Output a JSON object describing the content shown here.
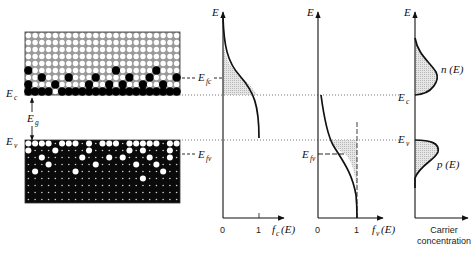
{
  "figure": {
    "lattice": {
      "columns": 23,
      "rows": 9,
      "conduction_band": {
        "description": "Conduction band: mostly empty states (white) with electrons (black) filling near the bottom",
        "filled_cells": [
          [
            5,
            0
          ],
          [
            5,
            13
          ],
          [
            5,
            19
          ],
          [
            6,
            2
          ],
          [
            6,
            6
          ],
          [
            6,
            10
          ],
          [
            6,
            15
          ],
          [
            6,
            18
          ],
          [
            6,
            22
          ],
          [
            7,
            0
          ],
          [
            7,
            4
          ],
          [
            7,
            9
          ],
          [
            7,
            12
          ],
          [
            7,
            14
          ],
          [
            7,
            17
          ],
          [
            7,
            20
          ],
          [
            8,
            0
          ],
          [
            8,
            1
          ],
          [
            8,
            3
          ],
          [
            8,
            5
          ],
          [
            8,
            7
          ],
          [
            8,
            8
          ],
          [
            8,
            11
          ],
          [
            8,
            12
          ],
          [
            8,
            13
          ],
          [
            8,
            15
          ],
          [
            8,
            16
          ],
          [
            8,
            18
          ],
          [
            8,
            19
          ],
          [
            8,
            21
          ],
          [
            8,
            22
          ]
        ],
        "bottom_row_filled": [
          1,
          2,
          3,
          5,
          6,
          7,
          9,
          10,
          11,
          12,
          13,
          14,
          16,
          17,
          18,
          19,
          20,
          21,
          22
        ]
      },
      "valence_band": {
        "description": "Valence band: mostly filled states (black) with holes (white) near the top",
        "top_row_holes": [
          0,
          1,
          2,
          3,
          5,
          6,
          7,
          9,
          11,
          12,
          13,
          15,
          16,
          17,
          18,
          19,
          21,
          22
        ],
        "holes": [
          [
            1,
            0
          ],
          [
            1,
            4
          ],
          [
            1,
            9
          ],
          [
            1,
            15
          ],
          [
            1,
            17
          ],
          [
            1,
            21
          ],
          [
            2,
            2
          ],
          [
            2,
            8
          ],
          [
            2,
            12
          ],
          [
            2,
            14
          ],
          [
            2,
            18
          ],
          [
            2,
            21
          ],
          [
            3,
            3
          ],
          [
            3,
            10
          ],
          [
            3,
            16
          ],
          [
            3,
            19
          ],
          [
            4,
            1
          ],
          [
            4,
            7
          ],
          [
            4,
            20
          ],
          [
            5,
            17
          ]
        ]
      }
    },
    "labels": {
      "Ec": "E",
      "Ec_sub": "c",
      "Ev": "E",
      "Ev_sub": "v",
      "Eg": "E",
      "Eg_sub": "g",
      "Efc": "E",
      "Efc_sub": "fc",
      "Efv": "E",
      "Efv_sub": "fv"
    },
    "plot_fc": {
      "y_axis_label": "E",
      "x_axis_label": "f",
      "x_axis_sub": "c",
      "x_axis_arg": "(E)",
      "ticks": [
        "0",
        "1"
      ]
    },
    "plot_fv": {
      "y_axis_label": "E",
      "x_axis_label": "f",
      "x_axis_sub": "v",
      "x_axis_arg": "(E)",
      "ticks": [
        "0",
        "1"
      ]
    },
    "plot_carriers": {
      "y_axis_label": "E",
      "x_axis_label_line1": "Carrier",
      "x_axis_label_line2": "concentration",
      "n_label": "n (E)",
      "p_label": "p (E)",
      "Ec_label": "E",
      "Ec_sub": "c",
      "Ev_label": "E",
      "Ev_sub": "v"
    }
  }
}
